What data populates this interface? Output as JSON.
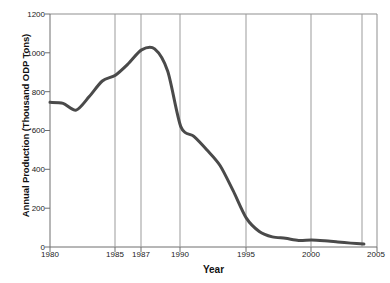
{
  "chart_data": {
    "type": "line",
    "title": "",
    "xlabel": "Year",
    "ylabel": "Annual Production (Thousand ODP Tons)",
    "xlim": [
      1980,
      2005
    ],
    "ylim": [
      0,
      1200
    ],
    "xticks": [
      1980,
      1985,
      1987,
      1990,
      1995,
      2000,
      2005
    ],
    "xtick_labels": [
      "1980",
      "1985",
      "1987",
      "1990",
      "1995",
      "2000",
      "2005"
    ],
    "yticks": [
      0,
      200,
      400,
      600,
      800,
      1000,
      1200
    ],
    "ytick_labels": [
      "0",
      "200",
      "400",
      "600",
      "800",
      "1000",
      "1200"
    ],
    "gridlines_x": [
      1985,
      1987,
      1990,
      1995,
      2000,
      2005
    ],
    "grid": "vertical-only",
    "legend": "none",
    "series": [
      {
        "name": "Annual Production",
        "color": "#4a4a4a",
        "x": [
          1980,
          1981,
          1982,
          1983,
          1984,
          1985,
          1986,
          1987,
          1988,
          1989,
          1990,
          1991,
          1992,
          1993,
          1994,
          1995,
          1996,
          1997,
          1998,
          1999,
          2000,
          2001,
          2002,
          2003,
          2004
        ],
        "values": [
          745,
          740,
          705,
          775,
          855,
          885,
          945,
          1015,
          1020,
          905,
          620,
          570,
          500,
          420,
          290,
          150,
          80,
          52,
          45,
          34,
          36,
          32,
          26,
          20,
          15
        ]
      }
    ]
  },
  "axes": {
    "line_color": "#4a4a4a",
    "border_color": "#888888",
    "grid_color": "#999999",
    "tick_color": "#666666",
    "text_color": "#111111"
  }
}
